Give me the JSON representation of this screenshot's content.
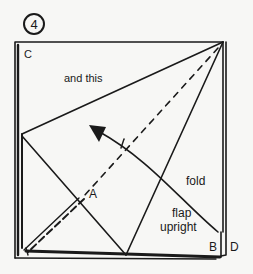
{
  "step": {
    "number": "4"
  },
  "labels": {
    "corner_c": "C",
    "corner_b": "B",
    "corner_d": "D",
    "point_a": "A",
    "instruction_top": "and this",
    "instruction_fold": "fold",
    "instruction_flap_1": "flap",
    "instruction_flap_2": "upright"
  },
  "colors": {
    "ink": "#1a1a1a",
    "paper": "#f7f7f5"
  }
}
